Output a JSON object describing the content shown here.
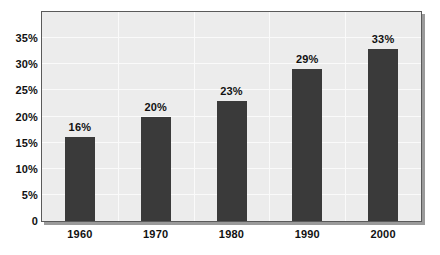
{
  "chart_data": {
    "type": "bar",
    "title": "",
    "subtitle": "",
    "xlabel": "",
    "ylabel": "",
    "categories": [
      "1960",
      "1970",
      "1980",
      "1990",
      "2000"
    ],
    "values": [
      16,
      20,
      23,
      29,
      33
    ],
    "data_labels": [
      "16%",
      "20%",
      "23%",
      "29%",
      "33%"
    ],
    "ylim": [
      0,
      40
    ],
    "ytick_values": [
      0,
      5,
      10,
      15,
      20,
      25,
      30,
      35
    ],
    "ytick_labels": [
      "0",
      "5%",
      "10%",
      "15%",
      "20%",
      "25%",
      "30%",
      "35%"
    ],
    "grid": true,
    "legend": null,
    "series": [
      {
        "name": "",
        "values": [
          16,
          20,
          23,
          29,
          33
        ]
      }
    ],
    "colors": {
      "bar": "#3a3a3a",
      "plot_background": "#ececec",
      "plot_border": "#5a5a5a",
      "gridline": "#fafafa",
      "text": "#111111",
      "canvas_background": "#ffffff"
    }
  }
}
